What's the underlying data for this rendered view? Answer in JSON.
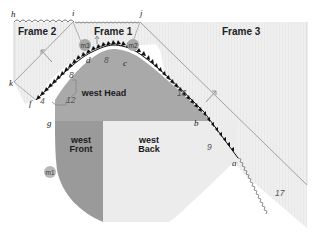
{
  "diagram": {
    "frames": [
      {
        "id": "frame2",
        "label": "Frame 2"
      },
      {
        "id": "frame1",
        "label": "Frame 1"
      },
      {
        "id": "frame3",
        "label": "Frame 3"
      }
    ],
    "regions": {
      "head": {
        "label": "west Head"
      },
      "front": {
        "line1": "west",
        "line2": "Front"
      },
      "back": {
        "line1": "west",
        "line2": "Back"
      }
    },
    "points": {
      "a": "a",
      "b": "b",
      "c": "c",
      "d": "d",
      "f": "f",
      "g": "g",
      "h": "h",
      "i": "i",
      "j": "j",
      "k": "k"
    },
    "markers": {
      "m1": "m1",
      "m2": "m2",
      "m3": "m3"
    },
    "numbers": {
      "n4": "4",
      "n8_top": "8",
      "n8_left": "8",
      "n9": "9",
      "n12": "12",
      "n16": "16",
      "n17": "17"
    },
    "colors": {
      "frame_fill": "#eeeeee",
      "head_fill": "#a9a9a9",
      "front_fill": "#9a9a9a",
      "back_fill": "#ececec",
      "front_triangles": "#111111",
      "lines": "#999999"
    }
  }
}
